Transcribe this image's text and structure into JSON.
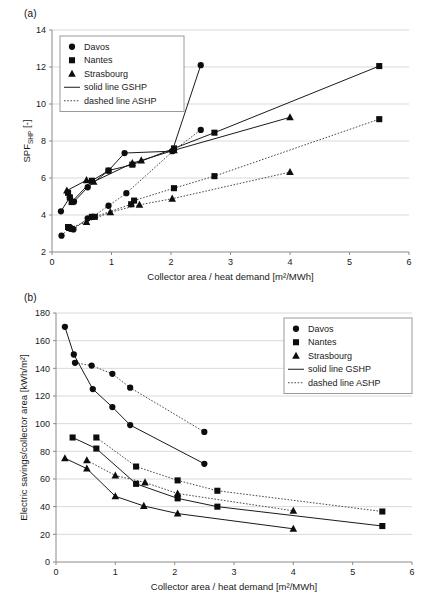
{
  "figure": {
    "panel_a_label": "(a)",
    "panel_b_label": "(b)"
  },
  "legend": {
    "items": [
      {
        "label": "Davos",
        "marker": "circle-marker"
      },
      {
        "label": "Nantes",
        "marker": "square-marker"
      },
      {
        "label": "Strasbourg",
        "marker": "triangle-marker"
      },
      {
        "label": "solid line GSHP",
        "marker": "solid-line-swatch"
      },
      {
        "label": "dashed line ASHP",
        "marker": "dashed-line-swatch"
      }
    ]
  },
  "chart_data": [
    {
      "id": "panel-a",
      "type": "line",
      "title": "(a)",
      "xlabel": "Collector area / heat demand [m²/MWh]",
      "ylabel_main": "SPF",
      "ylabel_sub": "SHP",
      "ylabel_unit": " [-]",
      "ylabel": "SPF_SHP [-]",
      "xlim": [
        0,
        6
      ],
      "ylim": [
        2,
        14
      ],
      "xticks": [
        0,
        1,
        2,
        3,
        4,
        5,
        6
      ],
      "yticks": [
        2,
        4,
        6,
        8,
        10,
        12,
        14
      ],
      "grid": "horizontal",
      "legend_position": "top-left",
      "series": [
        {
          "name": "Davos",
          "line": "solid",
          "marker": "circle",
          "heat_pump": "GSHP",
          "points": [
            [
              0.15,
              4.2
            ],
            [
              0.3,
              4.95
            ],
            [
              0.37,
              4.72
            ],
            [
              0.6,
              5.5
            ],
            [
              0.95,
              6.4
            ],
            [
              1.22,
              7.35
            ],
            [
              2.02,
              7.45
            ],
            [
              2.5,
              12.1
            ]
          ]
        },
        {
          "name": "Nantes",
          "line": "solid",
          "marker": "square",
          "heat_pump": "GSHP",
          "points": [
            [
              0.27,
              5.2
            ],
            [
              0.3,
              4.95
            ],
            [
              0.33,
              4.7
            ],
            [
              0.67,
              5.85
            ],
            [
              0.95,
              6.4
            ],
            [
              1.35,
              6.72
            ],
            [
              2.05,
              7.6
            ],
            [
              2.73,
              8.45
            ],
            [
              5.5,
              12.05
            ]
          ]
        },
        {
          "name": "Strasbourg",
          "line": "solid",
          "marker": "triangle",
          "heat_pump": "GSHP",
          "points": [
            [
              0.25,
              5.32
            ],
            [
              0.58,
              5.88
            ],
            [
              0.7,
              5.8
            ],
            [
              1.35,
              6.8
            ],
            [
              1.5,
              6.95
            ],
            [
              2.05,
              7.5
            ],
            [
              4.0,
              9.28
            ]
          ]
        },
        {
          "name": "Davos",
          "line": "dashed",
          "marker": "circle",
          "heat_pump": "ASHP",
          "points": [
            [
              0.16,
              2.88
            ],
            [
              0.3,
              3.35
            ],
            [
              0.36,
              3.22
            ],
            [
              0.6,
              3.82
            ],
            [
              0.68,
              3.9
            ],
            [
              0.95,
              4.5
            ],
            [
              1.25,
              5.18
            ],
            [
              2.05,
              7.5
            ],
            [
              2.5,
              8.6
            ]
          ]
        },
        {
          "name": "Nantes",
          "line": "dashed",
          "marker": "square",
          "heat_pump": "ASHP",
          "points": [
            [
              0.27,
              3.35
            ],
            [
              0.33,
              3.25
            ],
            [
              0.67,
              3.9
            ],
            [
              0.72,
              3.9
            ],
            [
              1.33,
              4.58
            ],
            [
              1.38,
              4.78
            ],
            [
              2.05,
              5.45
            ],
            [
              2.73,
              6.1
            ],
            [
              5.5,
              9.18
            ]
          ]
        },
        {
          "name": "Strasbourg",
          "line": "dashed",
          "marker": "triangle",
          "heat_pump": "ASHP",
          "points": [
            [
              0.3,
              3.3
            ],
            [
              0.58,
              3.62
            ],
            [
              0.98,
              4.15
            ],
            [
              1.47,
              4.55
            ],
            [
              2.02,
              4.88
            ],
            [
              4.0,
              6.32
            ]
          ]
        }
      ]
    },
    {
      "id": "panel-b",
      "type": "line",
      "title": "(b)",
      "xlabel": "Collector area / heat demand [m²/MWh]",
      "ylabel": "Electric savings/collector area [kWh/m²]",
      "xlim": [
        0,
        6
      ],
      "ylim": [
        0,
        180
      ],
      "xticks": [
        0,
        1,
        2,
        3,
        4,
        5,
        6
      ],
      "yticks": [
        0,
        20,
        40,
        60,
        80,
        100,
        120,
        140,
        160,
        180
      ],
      "grid": "horizontal",
      "legend_position": "top-right",
      "series": [
        {
          "name": "Davos",
          "line": "solid",
          "marker": "circle",
          "heat_pump": "GSHP",
          "points": [
            [
              0.15,
              170
            ],
            [
              0.3,
              150
            ],
            [
              0.62,
              125
            ],
            [
              0.95,
              112
            ],
            [
              1.25,
              99
            ],
            [
              2.5,
              71
            ]
          ]
        },
        {
          "name": "Davos",
          "line": "dashed",
          "marker": "circle",
          "heat_pump": "ASHP",
          "points": [
            [
              0.32,
              144
            ],
            [
              0.6,
              142
            ],
            [
              0.95,
              136
            ],
            [
              1.25,
              126
            ],
            [
              2.5,
              94
            ]
          ]
        },
        {
          "name": "Nantes",
          "line": "solid",
          "marker": "square",
          "heat_pump": "GSHP",
          "points": [
            [
              0.28,
              90
            ],
            [
              0.68,
              82
            ],
            [
              1.35,
              56.5
            ],
            [
              2.05,
              46
            ],
            [
              2.72,
              40
            ],
            [
              5.5,
              26
            ]
          ]
        },
        {
          "name": "Nantes",
          "line": "dashed",
          "marker": "square",
          "heat_pump": "ASHP",
          "points": [
            [
              0.68,
              90
            ],
            [
              1.35,
              69
            ],
            [
              2.05,
              59
            ],
            [
              2.72,
              51.5
            ],
            [
              5.5,
              36.5
            ]
          ]
        },
        {
          "name": "Strasbourg",
          "line": "solid",
          "marker": "triangle",
          "heat_pump": "GSHP",
          "points": [
            [
              0.15,
              75
            ],
            [
              0.52,
              67.5
            ],
            [
              1.0,
              47.5
            ],
            [
              1.48,
              40.5
            ],
            [
              2.05,
              35
            ],
            [
              4.0,
              24
            ]
          ]
        },
        {
          "name": "Strasbourg",
          "line": "dashed",
          "marker": "triangle",
          "heat_pump": "ASHP",
          "points": [
            [
              0.52,
              73.5
            ],
            [
              1.0,
              62.5
            ],
            [
              1.5,
              57.5
            ],
            [
              2.05,
              49.5
            ],
            [
              4.0,
              37
            ]
          ]
        }
      ]
    }
  ]
}
